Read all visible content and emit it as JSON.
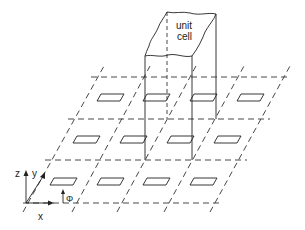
{
  "figure": {
    "type": "periodic surface array diagram",
    "unit_cell_label_line1": "unit",
    "unit_cell_label_line2": "cell",
    "axes": {
      "z": "z",
      "y": "y",
      "x": "x",
      "incident_field": "Φ"
    },
    "grid": {
      "rows": 3,
      "columns": 4,
      "slot_count": 12
    }
  }
}
